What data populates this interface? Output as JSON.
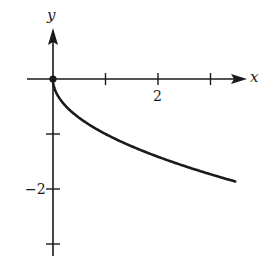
{
  "chart_data": {
    "type": "line",
    "title": "",
    "function": "y = -sqrt(x)",
    "xlabel": "x",
    "ylabel": "y",
    "xlim": [
      -0.5,
      3.6
    ],
    "ylim": [
      -3.2,
      0.9
    ],
    "grid": false,
    "legend": null,
    "x_ticks": [
      1,
      2,
      3
    ],
    "x_tick_labels": [
      "",
      "2",
      ""
    ],
    "y_ticks": [
      -1,
      -2,
      -3
    ],
    "y_tick_labels": [
      "",
      "-2",
      ""
    ],
    "series": [
      {
        "name": "y = -√x",
        "x": [
          0,
          0.05,
          0.1,
          0.25,
          0.5,
          0.75,
          1,
          1.5,
          2,
          2.5,
          3,
          3.47
        ],
        "y": [
          0,
          -0.224,
          -0.316,
          -0.5,
          -0.707,
          -0.866,
          -1,
          -1.225,
          -1.414,
          -1.581,
          -1.732,
          -1.863
        ],
        "color": "#1a1a1a",
        "start_point_marker": "filled-circle"
      }
    ],
    "annotations": [
      {
        "type": "point",
        "x": 0,
        "y": 0,
        "style": "filled-dot"
      }
    ]
  },
  "labels": {
    "x_axis": "x",
    "y_axis": "y",
    "x_tick_2": "2",
    "y_tick_neg2": "−2"
  },
  "colors": {
    "ink": "#1a1a1a",
    "background": "#ffffff"
  }
}
